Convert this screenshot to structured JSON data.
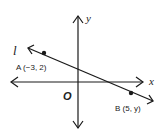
{
  "diagram": {
    "type": "coordinate-plane",
    "axes": {
      "x_label": "x",
      "y_label": "y",
      "origin_label": "O"
    },
    "line": {
      "label": "l"
    },
    "points": [
      {
        "name": "A",
        "label": "A (−3, 2)"
      },
      {
        "name": "B",
        "label": "B (5, y)"
      }
    ],
    "colors": {
      "stroke": "#1a1a1a",
      "text": "#222222",
      "background": "#ffffff"
    }
  }
}
